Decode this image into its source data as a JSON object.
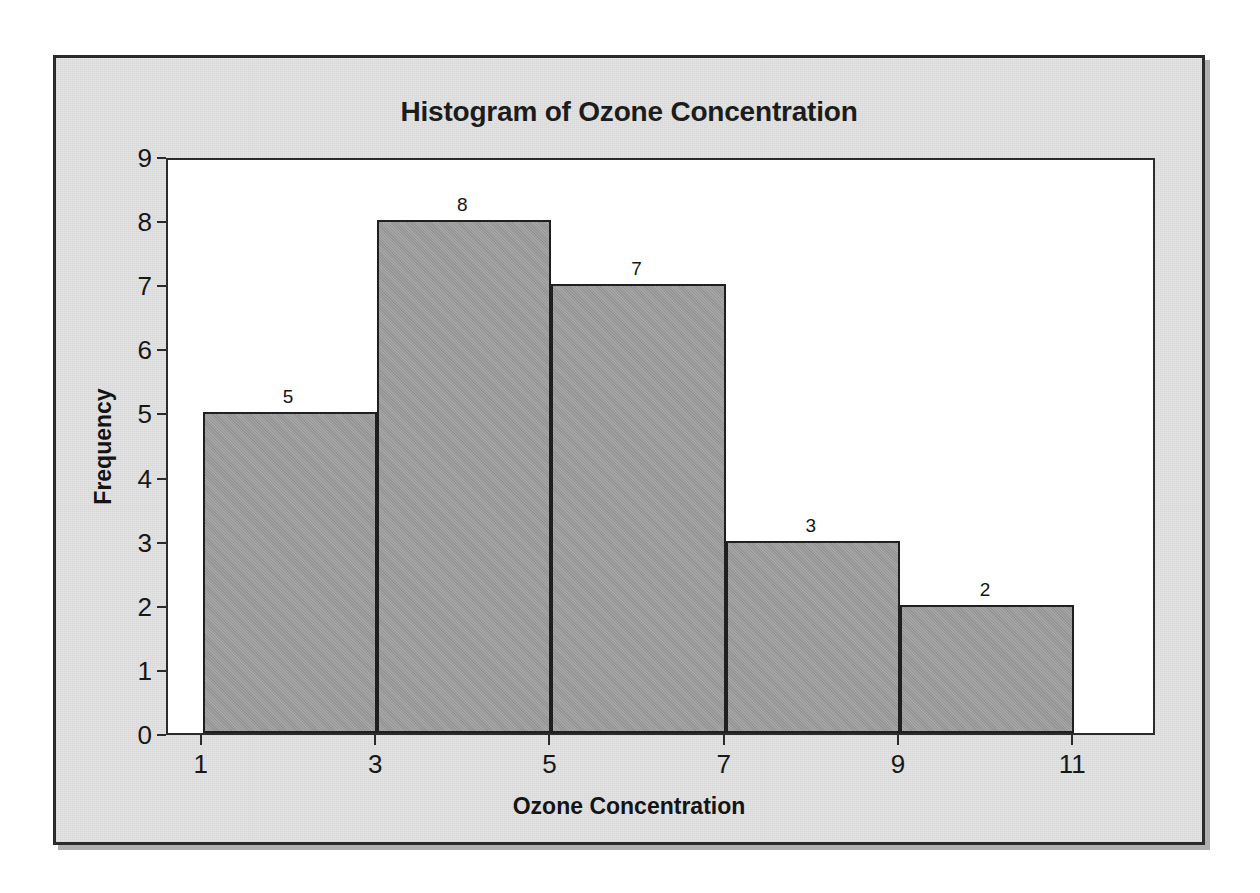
{
  "chart_data": {
    "type": "bar",
    "title": "Histogram of Ozone Concentration",
    "xlabel": "Ozone Concentration",
    "ylabel": "Frequency",
    "categories": [
      "1-3",
      "3-5",
      "5-7",
      "7-9",
      "9-11"
    ],
    "bin_edges": [
      1,
      3,
      5,
      7,
      9,
      11
    ],
    "values": [
      5,
      8,
      7,
      3,
      2
    ],
    "data_labels": [
      "5",
      "8",
      "7",
      "3",
      "2"
    ],
    "xticks": [
      "1",
      "3",
      "5",
      "7",
      "9",
      "11"
    ],
    "xtick_values": [
      1,
      3,
      5,
      7,
      9,
      11
    ],
    "yticks": [
      "0",
      "1",
      "2",
      "3",
      "4",
      "5",
      "6",
      "7",
      "8",
      "9"
    ],
    "ytick_values": [
      0,
      1,
      2,
      3,
      4,
      5,
      6,
      7,
      8,
      9
    ],
    "xlim": [
      0.6,
      11.95
    ],
    "ylim": [
      0,
      9
    ],
    "grid": false,
    "legend": false,
    "bar_fill_color": "#9c9c9c",
    "bar_edge_color": "#1f1f1f",
    "panel_color": "#e2e2e2",
    "plot_background_color": "#ffffff",
    "axis_color": "#2b2b2b",
    "text_color": "#171717"
  }
}
